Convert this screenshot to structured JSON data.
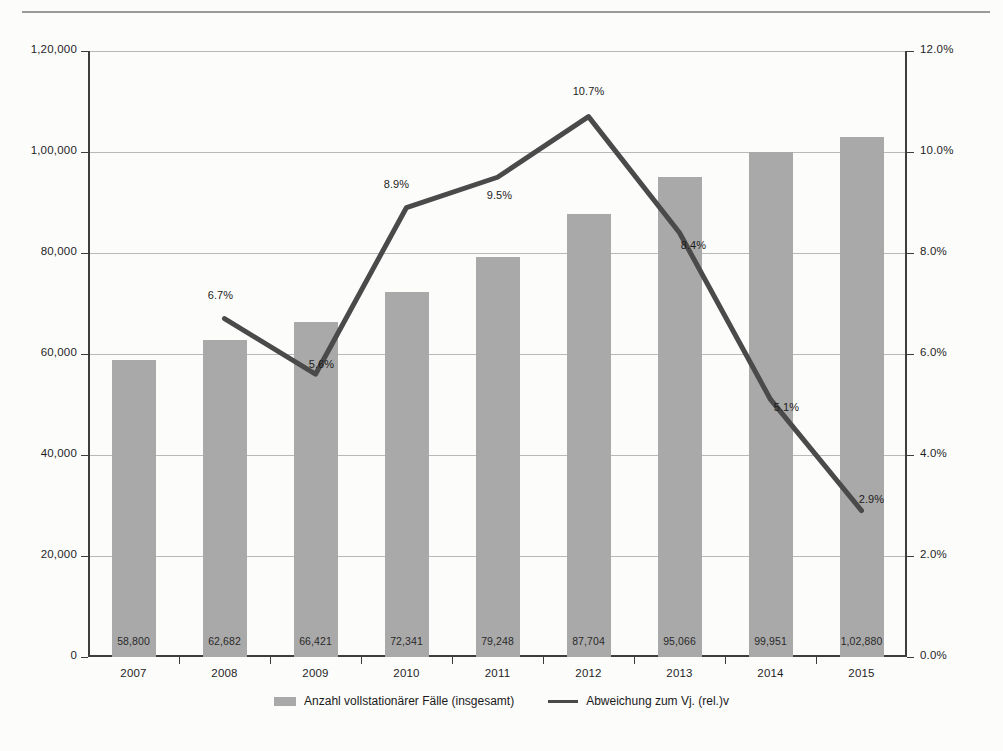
{
  "chart_data": {
    "type": "bar",
    "title": "",
    "subtitle": "",
    "xlabel": "",
    "ylabel": "",
    "grid": true,
    "legend_position": "bottom",
    "categories": [
      "2007",
      "2008",
      "2009",
      "2010",
      "2011",
      "2012",
      "2013",
      "2014",
      "2015"
    ],
    "axes": {
      "left": {
        "ticks": [
          "0",
          "20,000",
          "40,000",
          "60,000",
          "80,000",
          "1,00,000",
          "1,20,000"
        ],
        "tick_values": [
          0,
          20000,
          40000,
          60000,
          80000,
          100000,
          120000
        ],
        "ylim": [
          0,
          120000
        ]
      },
      "right": {
        "ticks": [
          "0.0%",
          "2.0%",
          "4.0%",
          "6.0%",
          "8.0%",
          "10.0%",
          "12.0%"
        ],
        "tick_values": [
          0,
          2,
          4,
          6,
          8,
          10,
          12
        ],
        "ylim": [
          0,
          12
        ]
      }
    },
    "series": [
      {
        "name": "Anzahl vollstationärer Fälle (insgesamt)",
        "type": "bar",
        "axis": "left",
        "color": "#a9a9a9",
        "values": [
          58800,
          62682,
          66421,
          72341,
          79248,
          87704,
          95066,
          99951,
          102880
        ],
        "labels": [
          "58,800",
          "62,682",
          "66,421",
          "72,341",
          "79,248",
          "87,704",
          "95,066",
          "99,951",
          "1,02,880"
        ]
      },
      {
        "name": "Abweichung zum Vj. (rel.)v",
        "type": "line",
        "axis": "right",
        "color": "#4a4a4a",
        "values": [
          null,
          6.7,
          5.6,
          8.9,
          9.5,
          10.7,
          8.4,
          5.1,
          2.9
        ],
        "labels": [
          "",
          "6.7%",
          "5.6%",
          "8.9%",
          "9.5%",
          "10.7%",
          "8.4%",
          "5.1%",
          "2.9%"
        ]
      }
    ]
  },
  "legend": {
    "items": [
      {
        "label": "Anzahl vollstationärer Fälle (insgesamt)",
        "marker": "bar-swatch"
      },
      {
        "label": "Abweichung zum Vj. (rel.)v",
        "marker": "line-swatch"
      }
    ]
  },
  "colors": {
    "bar": "#a9a9a9",
    "line": "#4a4a4a",
    "grid": "#b9b9b9",
    "axis": "#3d3d3d",
    "background": "#fcfcfb"
  }
}
